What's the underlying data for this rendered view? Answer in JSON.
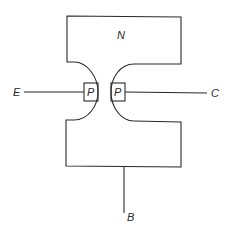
{
  "diagram": {
    "type": "junction-transistor-structure",
    "colors": {
      "line": "#2a2a2a",
      "background": "#ffffff"
    },
    "regions": {
      "base_region_label": "N",
      "emitter_junction_label": "P",
      "collector_junction_label": "P"
    },
    "terminals": {
      "emitter": "E",
      "collector": "C",
      "base": "B"
    }
  }
}
